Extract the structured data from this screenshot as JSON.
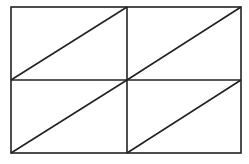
{
  "diagram": {
    "stroke_color": "#222222",
    "background": "#ffffff",
    "outer_rect": {
      "x1": 11,
      "y1": 7,
      "x2": 241,
      "y2": 153
    },
    "grid": {
      "rows": 2,
      "cols": 2,
      "mid_x": 127,
      "mid_y": 80
    },
    "cells": [
      {
        "row": 0,
        "col": 0,
        "diagonal": "bottom-left-to-top-right"
      },
      {
        "row": 0,
        "col": 1,
        "diagonal": "bottom-left-to-top-right"
      },
      {
        "row": 1,
        "col": 0,
        "diagonal": "bottom-left-to-top-right"
      },
      {
        "row": 1,
        "col": 1,
        "diagonal": "bottom-left-to-top-right"
      }
    ]
  }
}
